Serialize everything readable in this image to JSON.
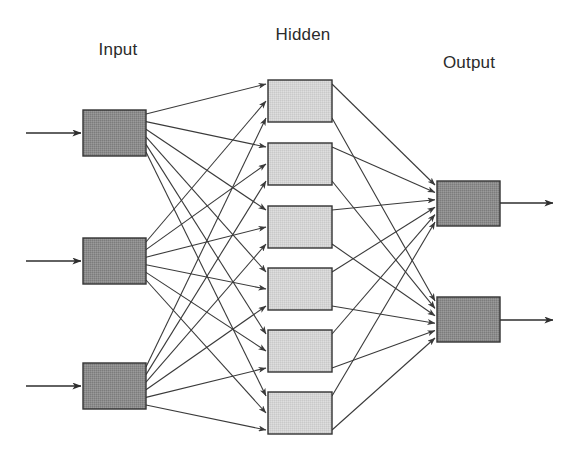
{
  "diagram": {
    "canvas": {
      "width": 578,
      "height": 453,
      "background": "#ffffff"
    },
    "labels": {
      "input": "Input",
      "hidden": "Hidden",
      "output": "Output"
    },
    "label_positions": {
      "input": {
        "x": 118,
        "y": 55
      },
      "hidden": {
        "x": 303,
        "y": 40
      },
      "output": {
        "x": 469,
        "y": 68
      }
    },
    "colors": {
      "input_fill": "#8c8c8c",
      "hidden_fill": "#d4d4d4",
      "output_fill": "#8c8c8c",
      "box_stroke": "#333333",
      "edge_stroke": "#3a3a3a",
      "label_text": "#2b2b2b",
      "background": "#ffffff"
    },
    "layers": [
      {
        "id": "input",
        "name": "Input",
        "node_count": 3,
        "box_width": 63,
        "box_height": 46,
        "x": 83,
        "fill": "#8c8c8c",
        "nodes": [
          {
            "id": "i1",
            "index": 1,
            "x": 83,
            "y": 110
          },
          {
            "id": "i2",
            "index": 2,
            "x": 83,
            "y": 238
          },
          {
            "id": "i3",
            "index": 3,
            "x": 83,
            "y": 363
          }
        ]
      },
      {
        "id": "hidden",
        "name": "Hidden",
        "node_count": 6,
        "box_width": 64,
        "box_height": 42,
        "x": 268,
        "fill": "#d4d4d4",
        "nodes": [
          {
            "id": "h1",
            "index": 1,
            "x": 268,
            "y": 80
          },
          {
            "id": "h2",
            "index": 2,
            "x": 268,
            "y": 143
          },
          {
            "id": "h3",
            "index": 3,
            "x": 268,
            "y": 206
          },
          {
            "id": "h4",
            "index": 4,
            "x": 268,
            "y": 268
          },
          {
            "id": "h5",
            "index": 5,
            "x": 268,
            "y": 330
          },
          {
            "id": "h6",
            "index": 6,
            "x": 268,
            "y": 392
          }
        ]
      },
      {
        "id": "output",
        "name": "Output",
        "node_count": 2,
        "box_width": 63,
        "box_height": 45,
        "x": 437,
        "fill": "#8c8c8c",
        "nodes": [
          {
            "id": "o1",
            "index": 1,
            "x": 437,
            "y": 181
          },
          {
            "id": "o2",
            "index": 2,
            "x": 437,
            "y": 297
          }
        ]
      }
    ],
    "connectivity": {
      "input_to_hidden": "fully-connected",
      "hidden_to_output": "fully-connected",
      "input_to_hidden_edge_count": 18,
      "hidden_to_output_edge_count": 12,
      "total_edges": 30,
      "directed": true
    },
    "external_arrows": {
      "inputs": [
        {
          "id": "in-arrow-1",
          "x1": 26,
          "y1": 133,
          "x2": 81,
          "y2": 133
        },
        {
          "id": "in-arrow-2",
          "x1": 26,
          "y1": 261,
          "x2": 81,
          "y2": 261
        },
        {
          "id": "in-arrow-3",
          "x1": 26,
          "y1": 386,
          "x2": 81,
          "y2": 386
        }
      ],
      "outputs": [
        {
          "id": "out-arrow-1",
          "x1": 500,
          "y1": 203,
          "x2": 553,
          "y2": 203
        },
        {
          "id": "out-arrow-2",
          "x1": 500,
          "y1": 320,
          "x2": 553,
          "y2": 320
        }
      ]
    }
  }
}
